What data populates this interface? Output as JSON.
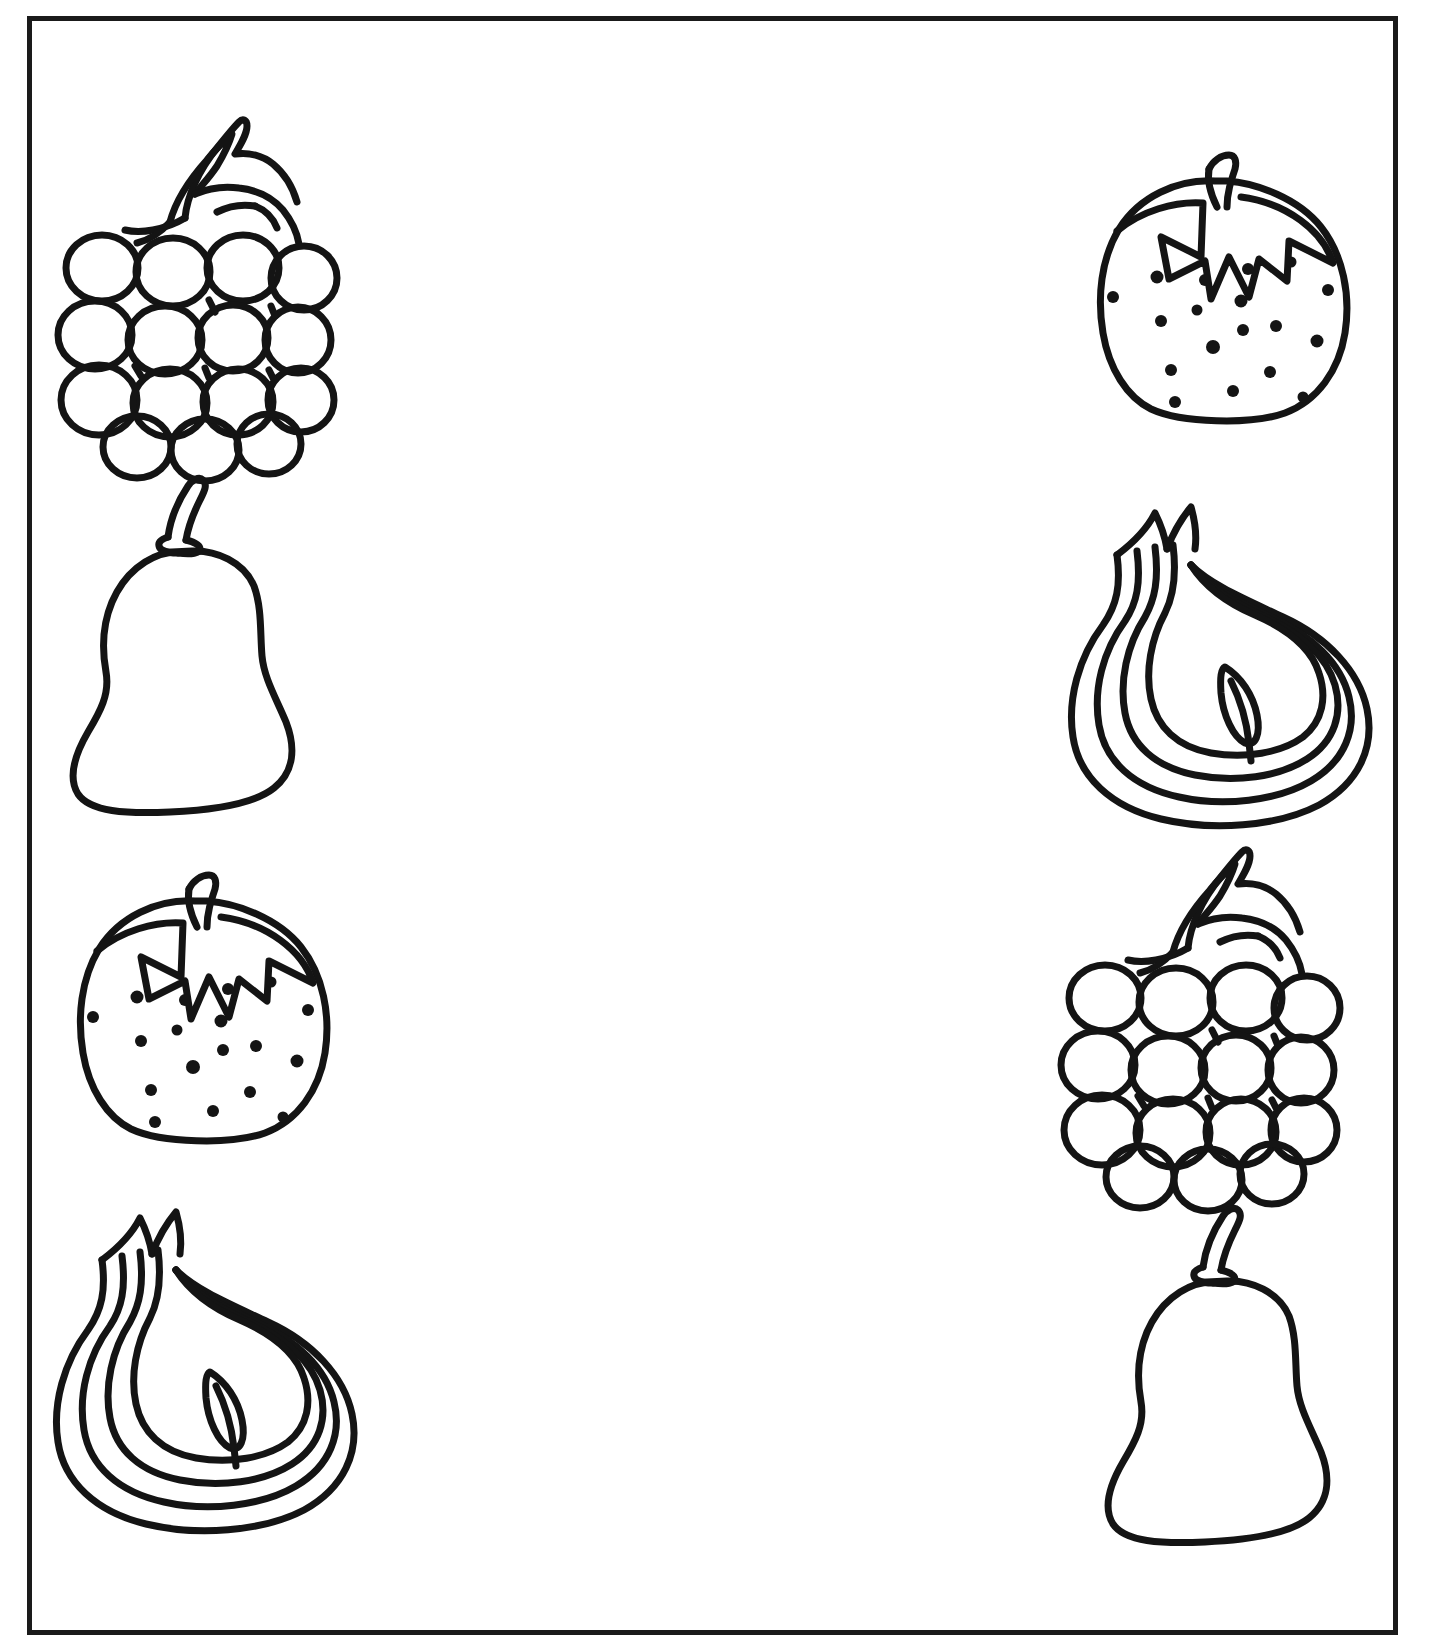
{
  "page": {
    "background_color": "#ffffff",
    "ink_color": "#141414",
    "border": {
      "name": "page-border-frame",
      "color": "#1a1a1a",
      "thickness_px": 5,
      "x": 27,
      "y": 16,
      "width": 1371,
      "height": 1619
    },
    "instruction_text": "",
    "columns": 2,
    "rows": 4
  },
  "left_column": {
    "label": "left-column",
    "items": [
      {
        "name": "grapes",
        "label": "Grapes",
        "row": 1,
        "x": 52,
        "y": 95,
        "width": 280,
        "height": 355
      },
      {
        "name": "pear",
        "label": "Pear",
        "row": 2,
        "x": 45,
        "y": 455,
        "width": 270,
        "height": 345
      },
      {
        "name": "strawberry",
        "label": "Strawberry",
        "row": 3,
        "x": 40,
        "y": 840,
        "width": 300,
        "height": 305
      },
      {
        "name": "onion",
        "label": "Onion",
        "row": 4,
        "x": 35,
        "y": 1185,
        "width": 320,
        "height": 345
      }
    ]
  },
  "right_column": {
    "label": "right-column",
    "items": [
      {
        "name": "strawberry",
        "label": "Strawberry",
        "row": 1,
        "x": 1060,
        "y": 120,
        "width": 300,
        "height": 305
      },
      {
        "name": "onion",
        "label": "Onion",
        "row": 2,
        "x": 1050,
        "y": 480,
        "width": 320,
        "height": 345
      },
      {
        "name": "grapes",
        "label": "Grapes",
        "row": 3,
        "x": 1055,
        "y": 825,
        "width": 280,
        "height": 355
      },
      {
        "name": "pear",
        "label": "Pear",
        "row": 4,
        "x": 1080,
        "y": 1185,
        "width": 270,
        "height": 345
      }
    ]
  },
  "icons": {
    "grapes": "grapes-icon",
    "pear": "pear-icon",
    "strawberry": "strawberry-icon",
    "onion": "onion-icon"
  }
}
